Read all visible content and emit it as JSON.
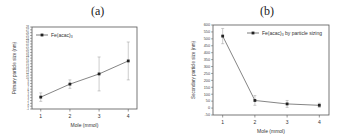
{
  "chart_data": [
    {
      "panel_label": "(a)",
      "type": "line",
      "title": "",
      "xlabel": "Mole (mmol)",
      "ylabel": "Primary particle size (nm)",
      "x": [
        1,
        2,
        3,
        4
      ],
      "xticks": [
        "1",
        "2",
        "3",
        "4"
      ],
      "ylim": [
        -1,
        28
      ],
      "yticks_step": 1,
      "grid": false,
      "legend_position": "upper left",
      "series": [
        {
          "name": "Fe(acac)3",
          "values": [
            3.2,
            7.8,
            11.4,
            16.0
          ],
          "error": [
            1.5,
            1.5,
            6.0,
            6.7
          ],
          "color": "#333333",
          "marker": "square"
        }
      ]
    },
    {
      "panel_label": "(b)",
      "type": "line",
      "title": "",
      "xlabel": "Mole (mmol)",
      "ylabel": "Secondary particle size (nm)",
      "x": [
        1,
        2,
        3,
        4
      ],
      "xticks": [
        "1",
        "2",
        "3",
        "4"
      ],
      "ylim": [
        -50,
        600
      ],
      "yticks": [
        -50,
        0,
        50,
        100,
        150,
        200,
        250,
        300,
        350,
        400,
        450,
        500,
        550,
        600
      ],
      "grid": false,
      "legend_position": "upper right",
      "series": [
        {
          "name": "Fe(acac)3 by particle sizing",
          "values": [
            520,
            55,
            30,
            20
          ],
          "error": [
            55,
            35,
            25,
            15
          ],
          "color": "#333333",
          "marker": "square"
        }
      ]
    }
  ],
  "panels": {
    "a": {
      "label": "(a)",
      "legend": "Fe(acac)",
      "legend_sub": "3",
      "xlabel": "Mole (mmol)",
      "ylabel": "Primary particle size (nm)"
    },
    "b": {
      "label": "(b)",
      "legend": "Fe(acac)",
      "legend_sub": "3",
      "legend_suffix": " by particle sizing",
      "xlabel": "Mole (mmol)",
      "ylabel": "Secondary particle size (nm)"
    }
  }
}
